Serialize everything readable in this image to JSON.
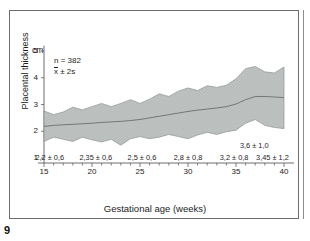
{
  "page": {
    "number": "9"
  },
  "figure": {
    "unit_label": "cm",
    "notes": {
      "sample": "n = 382",
      "dispersion_prefix": "x",
      "dispersion_suffix": " ± 2s"
    }
  },
  "chart_data": {
    "type": "area",
    "title": "",
    "xlabel": "Gestational age (weeks)",
    "ylabel": "Placental thickness",
    "yunit": "cm",
    "xlim": [
      14,
      41
    ],
    "ylim": [
      0.6,
      5.2
    ],
    "xticks": [
      "15",
      "20",
      "25",
      "30",
      "35",
      "40"
    ],
    "xtick_values": [
      15,
      20,
      25,
      30,
      35,
      40
    ],
    "yticks": [
      "1",
      "2",
      "3",
      "4",
      "5"
    ],
    "ytick_values": [
      1,
      2,
      3,
      4,
      5
    ],
    "grid": false,
    "legend": "none",
    "annotations": {
      "sample_size": "n = 382",
      "band_meaning": "x̄ ± 2s",
      "value_labels": [
        {
          "text": "2,2 ± 0,6",
          "week": 15.6,
          "row": "bottom"
        },
        {
          "text": "2,35 ± 0,6",
          "week": 20.4,
          "row": "bottom"
        },
        {
          "text": "2,5 ± 0,6",
          "week": 25.2,
          "row": "bottom"
        },
        {
          "text": "2,8 ± 0,8",
          "week": 30.0,
          "row": "bottom"
        },
        {
          "text": "3,2 ± 0,8",
          "week": 34.8,
          "row": "bottom"
        },
        {
          "text": "3,45 ± 1,2",
          "week": 38.8,
          "row": "bottom"
        },
        {
          "text": "3,6 ± 1,0",
          "week": 36.9,
          "row": "upper"
        }
      ]
    },
    "x": [
      15,
      16,
      17,
      18,
      19,
      20,
      21,
      22,
      23,
      24,
      25,
      26,
      27,
      28,
      29,
      30,
      31,
      32,
      33,
      34,
      35,
      36,
      37,
      38,
      39,
      40
    ],
    "series": [
      {
        "name": "mean (x̄)",
        "role": "mean-line",
        "values": [
          2.18,
          2.22,
          2.24,
          2.26,
          2.28,
          2.3,
          2.33,
          2.35,
          2.37,
          2.4,
          2.44,
          2.5,
          2.56,
          2.62,
          2.68,
          2.74,
          2.79,
          2.83,
          2.87,
          2.92,
          3.02,
          3.18,
          3.3,
          3.3,
          3.28,
          3.26
        ]
      },
      {
        "name": "upper (x̄ + 2s)",
        "role": "band-upper",
        "values": [
          2.76,
          2.62,
          2.72,
          2.9,
          2.8,
          2.92,
          3.04,
          2.92,
          3.04,
          3.18,
          3.04,
          3.2,
          3.4,
          3.3,
          3.5,
          3.62,
          3.52,
          3.7,
          3.64,
          3.72,
          3.96,
          4.34,
          4.42,
          4.22,
          4.18,
          4.4
        ]
      },
      {
        "name": "lower (x̄ − 2s)",
        "role": "band-lower",
        "values": [
          1.62,
          1.78,
          1.7,
          1.62,
          1.78,
          1.68,
          1.6,
          1.7,
          1.48,
          1.72,
          1.8,
          1.72,
          1.78,
          1.88,
          1.8,
          1.72,
          1.86,
          1.96,
          1.88,
          1.98,
          2.04,
          2.3,
          2.44,
          2.22,
          2.14,
          2.1
        ]
      }
    ]
  }
}
